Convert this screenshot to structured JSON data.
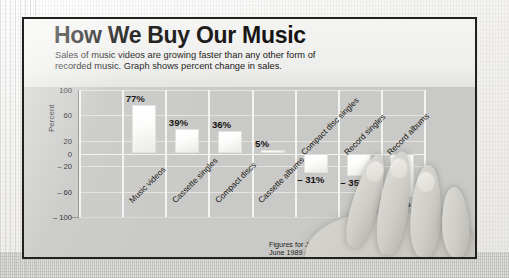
{
  "article": {
    "title": "How We Buy Our Music",
    "subtitle": "Sales of music videos are growing faster than any other form of recorded music. Graph shows percent change in sales.",
    "footnote_line1": "Figures for January through",
    "footnote_line2": "June 1989 and 1990"
  },
  "chart_data": {
    "type": "bar",
    "title": "How We Buy Our Music",
    "subtitle": "Sales of music videos are growing faster than any other form of recorded music. Graph shows percent change in sales.",
    "categories": [
      "Music videos",
      "Cassette singles",
      "Compact discs",
      "Cassette albums",
      "Compact disc singles",
      "Record singles",
      "Record albums"
    ],
    "values": [
      77,
      39,
      36,
      5,
      -31,
      -35,
      -68
    ],
    "data_labels": [
      "77%",
      "39%",
      "36%",
      "5%",
      "– 31%",
      "– 35%",
      "– 68%"
    ],
    "xlabel": "",
    "ylabel": "Percent",
    "ylim": [
      -100,
      100
    ],
    "yticks": [
      100,
      60,
      20,
      0,
      -20,
      -60,
      -100
    ],
    "ytick_labels": [
      "100",
      "60",
      "20",
      "0",
      "– 20",
      "– 60",
      "– 100"
    ],
    "grid": true,
    "legend": "none",
    "annotation": "Figures for January through June 1989 and 1990",
    "colors": {
      "bar_fill": "#ffffff",
      "plot_background": "#c9c9c7",
      "gridline": "#f4f4f2",
      "text": "#151413"
    }
  }
}
